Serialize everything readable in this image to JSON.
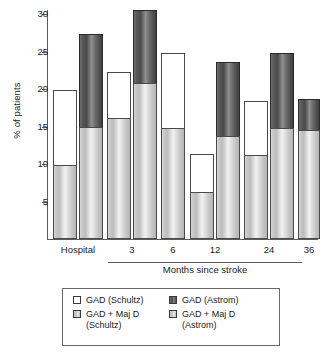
{
  "chart_data": {
    "type": "bar",
    "subtype": "grouped-stacked",
    "title": "",
    "xlabel": "Months since stroke",
    "ylabel": "% of patients",
    "ylim": [
      0,
      32
    ],
    "yticks": [
      5,
      10,
      15,
      20,
      25,
      30
    ],
    "grid": false,
    "legend_position": "bottom",
    "categories": [
      "Hospital",
      "3",
      "6",
      "12",
      "24",
      "36"
    ],
    "series": [
      {
        "name": "GAD (Schultz)",
        "key": "gad_schultz",
        "color": "#ffffff",
        "style": "open",
        "note": "upper open portion of the Schultz bar; value is total height of Schultz bar",
        "values": [
          19.9,
          22.3,
          24.8,
          11.4,
          18.4,
          null
        ]
      },
      {
        "name": "GAD + Maj D (Schultz)",
        "key": "gad_majd_schultz",
        "color": "#cfcfcf",
        "style": "light",
        "note": "lower shaded portion of the Schultz bar",
        "values": [
          9.9,
          16.1,
          14.8,
          6.3,
          11.2,
          null
        ]
      },
      {
        "name": "GAD (Astrom)",
        "key": "gad_astrom",
        "color": "#555555",
        "style": "dark",
        "note": "upper dark portion of the Astrom bar; value is total height of Astrom bar",
        "values": [
          27.3,
          30.6,
          null,
          23.6,
          24.8,
          18.7
        ]
      },
      {
        "name": "GAD + Maj D (Astrom)",
        "key": "gad_majd_astrom",
        "color": "#cfcfcf",
        "style": "light",
        "note": "lower shaded portion of the Astrom bar",
        "values": [
          14.9,
          20.8,
          null,
          13.7,
          14.8,
          14.6
        ]
      }
    ],
    "bars": [
      {
        "group": "Hospital",
        "source": "Schultz",
        "x": 53,
        "width": 24,
        "lower": 9.9,
        "total": 19.9
      },
      {
        "group": "Hospital",
        "source": "Astrom",
        "x": 79,
        "width": 24,
        "lower": 14.9,
        "total": 27.3
      },
      {
        "group": "3",
        "source": "Schultz",
        "x": 107,
        "width": 24,
        "lower": 16.1,
        "total": 22.3
      },
      {
        "group": "3",
        "source": "Astrom",
        "x": 133,
        "width": 24,
        "lower": 20.8,
        "total": 30.6
      },
      {
        "group": "6",
        "source": "Schultz",
        "x": 161,
        "width": 24,
        "lower": 14.8,
        "total": 24.8
      },
      {
        "group": "12",
        "source": "Schultz",
        "x": 190,
        "width": 24,
        "lower": 6.3,
        "total": 11.4
      },
      {
        "group": "12",
        "source": "Astrom",
        "x": 216,
        "width": 24,
        "lower": 13.7,
        "total": 23.6
      },
      {
        "group": "24",
        "source": "Schultz",
        "x": 244,
        "width": 24,
        "lower": 11.2,
        "total": 18.4
      },
      {
        "group": "24",
        "source": "Astrom",
        "x": 270,
        "width": 24,
        "lower": 14.8,
        "total": 24.8
      },
      {
        "group": "36",
        "source": "Astrom",
        "x": 298,
        "width": 22,
        "lower": 14.6,
        "total": 18.7
      }
    ]
  },
  "axis": {
    "y_title": "% of patients",
    "x_title": "Months since stroke",
    "y_ticks": [
      "30",
      "25",
      "20",
      "15",
      "10",
      "5"
    ],
    "x_ticks": [
      "Hospital",
      "3",
      "6",
      "12",
      "24",
      "36"
    ]
  },
  "legend": {
    "items": [
      {
        "label": "GAD (Schultz)",
        "style": "open"
      },
      {
        "label": "GAD (Astrom)",
        "style": "dark"
      },
      {
        "label": "GAD + Maj D\n(Schultz)",
        "style": "light"
      },
      {
        "label": "GAD + Maj D\n(Astrom)",
        "style": "light"
      }
    ]
  }
}
